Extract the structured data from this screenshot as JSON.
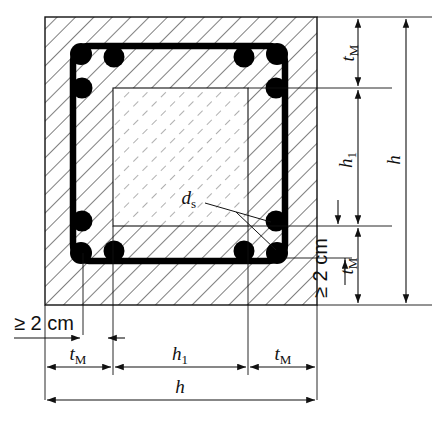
{
  "figure": {
    "kind": "engineering-cross-section",
    "colors": {
      "line": "#111111",
      "hatch_outer": "#555555",
      "hatch_inner": "#888888",
      "stirrup": "#000000",
      "rebar": "#000000",
      "background": "#ffffff"
    }
  },
  "labels": {
    "t_m_top": {
      "base": "t",
      "sub": "M"
    },
    "t_m_bottom": {
      "base": "t",
      "sub": "M"
    },
    "t_m_left": {
      "base": "t",
      "sub": "M"
    },
    "t_m_right": {
      "base": "t",
      "sub": "M"
    },
    "h1_vertical": {
      "base": "h",
      "sub": "1"
    },
    "h1_horizontal": {
      "base": "h",
      "sub": "1"
    },
    "h_vertical": {
      "base": "h",
      "sub": ""
    },
    "h_horizontal": {
      "base": "h",
      "sub": ""
    },
    "d_s": {
      "base": "d",
      "sub": "s"
    },
    "cover_left": "≥ 2 cm",
    "cover_right": "≥ 2 cm"
  },
  "dimensions": {
    "vertical": [
      {
        "name": "t_M",
        "label": "t_M",
        "position": "right-inner-top"
      },
      {
        "name": "h_1",
        "label": "h_1",
        "position": "right-inner-middle"
      },
      {
        "name": "t_M",
        "label": "t_M",
        "position": "right-inner-bottom"
      },
      {
        "name": "h",
        "label": "h",
        "position": "right-outer"
      },
      {
        "name": "cover",
        "label": "≥ 2 cm",
        "position": "right-cover"
      }
    ],
    "horizontal": [
      {
        "name": "t_M",
        "label": "t_M",
        "position": "bottom-left"
      },
      {
        "name": "h_1",
        "label": "h_1",
        "position": "bottom-middle"
      },
      {
        "name": "t_M",
        "label": "t_M",
        "position": "bottom-right"
      },
      {
        "name": "h",
        "label": "h",
        "position": "bottom-outer"
      },
      {
        "name": "cover",
        "label": "≥ 2 cm",
        "position": "bottom-left-cover"
      }
    ]
  },
  "rebars": {
    "diameter_symbol": "d_s",
    "count": 12,
    "description": "corner bar clusters, three bars per corner"
  }
}
